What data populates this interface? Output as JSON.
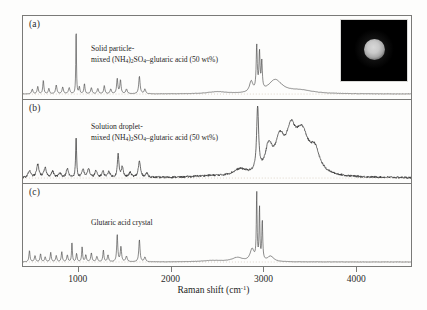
{
  "figure": {
    "background_color": "#fdfdfc",
    "frame_color": "#7a7a78",
    "trace_color": "#3a3a3a"
  },
  "axis": {
    "xlabel_text": "Raman shift (cm",
    "xlabel_sup": "-1",
    "xlabel_close": ")",
    "xlabel_full": "Raman shift (cm-1)",
    "xticks": [
      1000,
      2000,
      3000,
      4000
    ],
    "xticklabels": [
      "1000",
      "2000",
      "3000",
      "4000"
    ],
    "xlim": [
      400,
      4600
    ],
    "ylabel": "",
    "yticks": []
  },
  "panels": [
    {
      "tag": "(a)",
      "caption_line1": "Solid particle-",
      "caption_line2_pre": "mixed (NH",
      "caption_sub1": "4",
      "caption_line2_mid1": ")",
      "caption_sub2": "2",
      "caption_line2_mid2": "SO",
      "caption_sub3": "4",
      "caption_line2_post": "–glutaric acid (50 wt%)",
      "caption_full": "Solid particle-mixed (NH4)2SO4-glutaric acid (50 wt%)",
      "has_inset": true,
      "noise": "smooth"
    },
    {
      "tag": "(b)",
      "caption_line1": "Solution droplet-",
      "caption_line2_pre": "mixed (NH",
      "caption_sub1": "4",
      "caption_line2_mid1": ")",
      "caption_sub2": "2",
      "caption_line2_mid2": "SO",
      "caption_sub3": "4",
      "caption_line2_post": "–glutaric acid (50 wt%)",
      "caption_full": "Solution droplet-mixed (NH4)2SO4-glutaric acid (50 wt%)",
      "has_inset": false,
      "noise": "noisy"
    },
    {
      "tag": "(c)",
      "caption_line1": "Glutaric acid crystal",
      "caption_line2_pre": "",
      "caption_sub1": "",
      "caption_line2_mid1": "",
      "caption_sub2": "",
      "caption_line2_mid2": "",
      "caption_sub3": "",
      "caption_line2_post": "",
      "caption_full": "Glutaric acid crystal",
      "has_inset": false,
      "noise": "smooth"
    }
  ],
  "inset": {
    "name": "optical-micrograph-of-particle",
    "background_color": "#000000",
    "particle_color": "#c9c9c9",
    "description": "bright round particle on black background"
  },
  "chart_data": {
    "type": "line",
    "title": "",
    "xlabel": "Raman shift (cm-1)",
    "ylabel": "Raman intensity (arbitrary units)",
    "xlim": [
      400,
      4600
    ],
    "grid": false,
    "legend": "none",
    "series": [
      {
        "name": "(a) Solid particle-mixed (NH4)2SO4-glutaric acid (50 wt%)",
        "panel": "a",
        "baseline_dotted": true,
        "peaks": [
          {
            "x": 500,
            "h": 0.07,
            "w": 9
          },
          {
            "x": 560,
            "h": 0.11,
            "w": 8
          },
          {
            "x": 620,
            "h": 0.2,
            "w": 7
          },
          {
            "x": 680,
            "h": 0.08,
            "w": 8
          },
          {
            "x": 760,
            "h": 0.13,
            "w": 9
          },
          {
            "x": 830,
            "h": 0.1,
            "w": 9
          },
          {
            "x": 900,
            "h": 0.09,
            "w": 10
          },
          {
            "x": 975,
            "h": 1.0,
            "w": 4
          },
          {
            "x": 1010,
            "h": 0.1,
            "w": 7
          },
          {
            "x": 1065,
            "h": 0.15,
            "w": 7
          },
          {
            "x": 1140,
            "h": 0.09,
            "w": 9
          },
          {
            "x": 1210,
            "h": 0.08,
            "w": 9
          },
          {
            "x": 1280,
            "h": 0.12,
            "w": 8
          },
          {
            "x": 1350,
            "h": 0.07,
            "w": 9
          },
          {
            "x": 1420,
            "h": 0.22,
            "w": 8
          },
          {
            "x": 1455,
            "h": 0.2,
            "w": 8
          },
          {
            "x": 1520,
            "h": 0.07,
            "w": 10
          },
          {
            "x": 1660,
            "h": 0.26,
            "w": 9
          },
          {
            "x": 1720,
            "h": 0.07,
            "w": 10
          },
          {
            "x": 2500,
            "h": 0.03,
            "w": 120
          },
          {
            "x": 2870,
            "h": 0.16,
            "w": 22
          },
          {
            "x": 2930,
            "h": 0.66,
            "w": 7
          },
          {
            "x": 2960,
            "h": 0.55,
            "w": 7
          },
          {
            "x": 2985,
            "h": 0.4,
            "w": 7
          },
          {
            "x": 3130,
            "h": 0.2,
            "w": 90
          },
          {
            "x": 3400,
            "h": 0.05,
            "w": 170
          }
        ]
      },
      {
        "name": "(b) Solution droplet-mixed (NH4)2SO4-glutaric acid (50 wt%)",
        "panel": "b",
        "baseline_dotted": true,
        "peaks": [
          {
            "x": 470,
            "h": 0.1,
            "w": 18
          },
          {
            "x": 560,
            "h": 0.19,
            "w": 16
          },
          {
            "x": 640,
            "h": 0.14,
            "w": 16
          },
          {
            "x": 720,
            "h": 0.09,
            "w": 16
          },
          {
            "x": 800,
            "h": 0.07,
            "w": 16
          },
          {
            "x": 880,
            "h": 0.13,
            "w": 14
          },
          {
            "x": 975,
            "h": 0.62,
            "w": 6
          },
          {
            "x": 1050,
            "h": 0.12,
            "w": 14
          },
          {
            "x": 1110,
            "h": 0.13,
            "w": 14
          },
          {
            "x": 1190,
            "h": 0.1,
            "w": 14
          },
          {
            "x": 1265,
            "h": 0.09,
            "w": 14
          },
          {
            "x": 1330,
            "h": 0.09,
            "w": 14
          },
          {
            "x": 1430,
            "h": 0.34,
            "w": 10
          },
          {
            "x": 1475,
            "h": 0.16,
            "w": 12
          },
          {
            "x": 1560,
            "h": 0.07,
            "w": 16
          },
          {
            "x": 1660,
            "h": 0.24,
            "w": 14
          },
          {
            "x": 1740,
            "h": 0.06,
            "w": 16
          },
          {
            "x": 2400,
            "h": 0.02,
            "w": 200
          },
          {
            "x": 2750,
            "h": 0.1,
            "w": 90
          },
          {
            "x": 2940,
            "h": 0.95,
            "w": 13
          },
          {
            "x": 3060,
            "h": 0.38,
            "w": 45
          },
          {
            "x": 3180,
            "h": 0.46,
            "w": 60
          },
          {
            "x": 3300,
            "h": 0.52,
            "w": 60
          },
          {
            "x": 3420,
            "h": 0.6,
            "w": 90
          },
          {
            "x": 3560,
            "h": 0.3,
            "w": 60
          }
        ]
      },
      {
        "name": "(c) Glutaric acid crystal",
        "panel": "c",
        "baseline_dotted": true,
        "peaks": [
          {
            "x": 470,
            "h": 0.17,
            "w": 7
          },
          {
            "x": 530,
            "h": 0.09,
            "w": 8
          },
          {
            "x": 590,
            "h": 0.12,
            "w": 7
          },
          {
            "x": 640,
            "h": 0.07,
            "w": 8
          },
          {
            "x": 700,
            "h": 0.14,
            "w": 7
          },
          {
            "x": 760,
            "h": 0.09,
            "w": 8
          },
          {
            "x": 820,
            "h": 0.15,
            "w": 7
          },
          {
            "x": 880,
            "h": 0.1,
            "w": 8
          },
          {
            "x": 930,
            "h": 0.3,
            "w": 5
          },
          {
            "x": 980,
            "h": 0.12,
            "w": 7
          },
          {
            "x": 1040,
            "h": 0.22,
            "w": 6
          },
          {
            "x": 1080,
            "h": 0.1,
            "w": 8
          },
          {
            "x": 1140,
            "h": 0.13,
            "w": 8
          },
          {
            "x": 1200,
            "h": 0.08,
            "w": 9
          },
          {
            "x": 1270,
            "h": 0.17,
            "w": 7
          },
          {
            "x": 1320,
            "h": 0.1,
            "w": 8
          },
          {
            "x": 1420,
            "h": 0.4,
            "w": 7
          },
          {
            "x": 1460,
            "h": 0.22,
            "w": 8
          },
          {
            "x": 1520,
            "h": 0.08,
            "w": 10
          },
          {
            "x": 1660,
            "h": 0.33,
            "w": 8
          },
          {
            "x": 1720,
            "h": 0.07,
            "w": 10
          },
          {
            "x": 2450,
            "h": 0.02,
            "w": 150
          },
          {
            "x": 2720,
            "h": 0.06,
            "w": 70
          },
          {
            "x": 2880,
            "h": 0.18,
            "w": 26
          },
          {
            "x": 2930,
            "h": 1.0,
            "w": 5
          },
          {
            "x": 2960,
            "h": 0.78,
            "w": 5
          },
          {
            "x": 2990,
            "h": 0.58,
            "w": 6
          },
          {
            "x": 3080,
            "h": 0.08,
            "w": 40
          }
        ]
      }
    ]
  }
}
